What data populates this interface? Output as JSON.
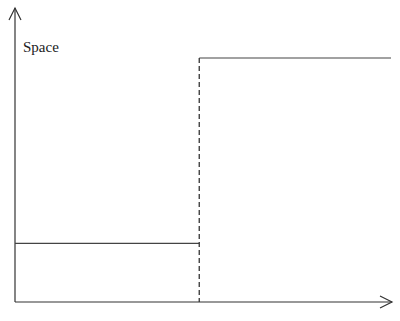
{
  "diagram": {
    "y_axis_label": "Space",
    "x_axis_label": "",
    "levels": {
      "low": 0.24,
      "high": 1.0
    },
    "step_position": 0.49,
    "colors": {
      "line": "#444444",
      "axis": "#333333",
      "background": "#ffffff"
    }
  }
}
